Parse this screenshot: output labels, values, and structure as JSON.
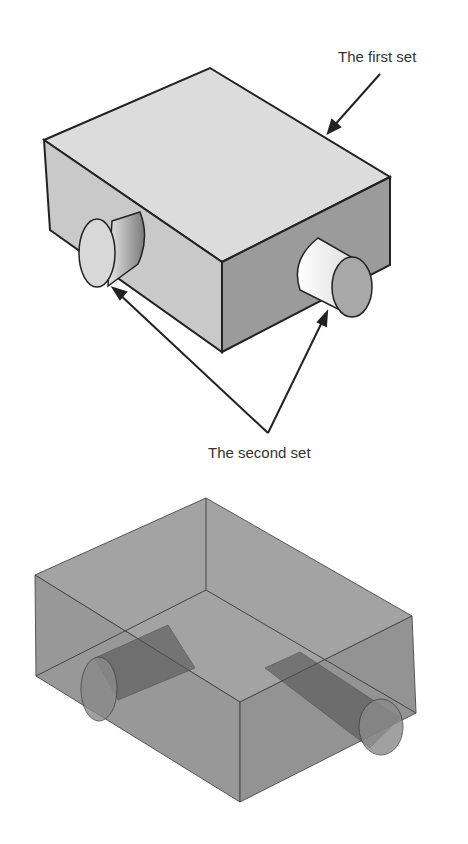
{
  "figure_top": {
    "description": "Opaque rectangular box with two cylindrical bosses",
    "labels": {
      "first_set": "The first set",
      "second_set": "The second set"
    }
  },
  "figure_bottom": {
    "description": "Transparent view of box with cylinders passing through"
  },
  "colors": {
    "top_face": "#dcdcdc",
    "left_face": "#c8c8c8",
    "right_face": "#9a9a9a",
    "outline": "#222222",
    "transparent_fill": "#8a8a8a"
  }
}
